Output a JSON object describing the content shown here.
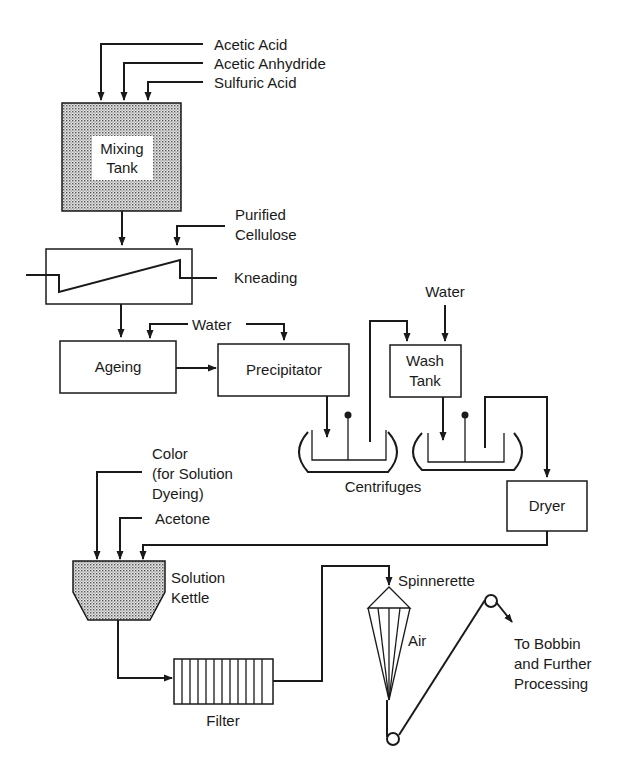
{
  "diagram": {
    "title": "",
    "inputs": {
      "acetic_acid": "Acetic Acid",
      "acetic_anhydride": "Acetic Anhydride",
      "sulfuric_acid": "Sulfuric Acid",
      "purified_cellulose_1": "Purified",
      "purified_cellulose_2": "Cellulose",
      "water_ageing": "Water",
      "water_wash": "Water",
      "color_1": "Color",
      "color_2": "(for Solution",
      "color_3": "Dyeing)",
      "acetone": "Acetone"
    },
    "units": {
      "mixing_tank_1": "Mixing",
      "mixing_tank_2": "Tank",
      "kneading": "Kneading",
      "ageing": "Ageing",
      "precipitator": "Precipitator",
      "wash_tank_1": "Wash",
      "wash_tank_2": "Tank",
      "centrifuges": "Centrifuges",
      "dryer": "Dryer",
      "solution_kettle_1": "Solution",
      "solution_kettle_2": "Kettle",
      "filter": "Filter",
      "spinnerette": "Spinnerette",
      "air": "Air"
    },
    "outputs": {
      "bobbin_1": "To Bobbin",
      "bobbin_2": "and Further",
      "bobbin_3": "Processing"
    },
    "colors": {
      "line": "#1a1a1a",
      "shade": "#bdbdbd",
      "background": "#ffffff"
    }
  }
}
